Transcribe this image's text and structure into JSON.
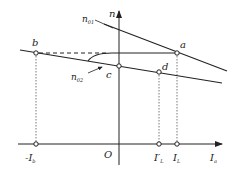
{
  "diagram": {
    "axes": {
      "y_label": "n",
      "x_label": "I",
      "x_label_sub": "a",
      "origin_label": "O"
    },
    "points": {
      "a": "a",
      "b": "b",
      "c": "c",
      "d": "d"
    },
    "curves": {
      "n01": {
        "label": "n",
        "sub": "01"
      },
      "n02": {
        "label": "n",
        "sub": "02"
      }
    },
    "x_ticks": [
      {
        "label": "-I",
        "sub": "b"
      },
      {
        "label": "I′",
        "sub": "L"
      },
      {
        "label": "I",
        "sub": "L"
      }
    ],
    "colors": {
      "stroke": "#222222",
      "guide": "#555555",
      "background": "#ffffff"
    }
  }
}
